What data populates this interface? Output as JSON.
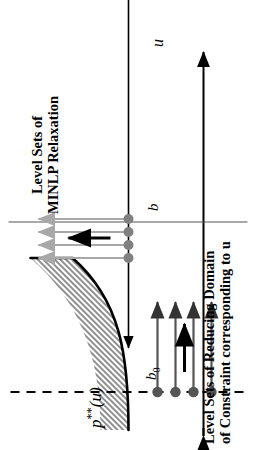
{
  "figure": {
    "background_color": "#ffffff",
    "captions": {
      "left": {
        "line1": "Level Sets of Reducing Domain",
        "line2": "of Constraint corresponding to u"
      },
      "right": {
        "line1": "Level Sets of",
        "line2": "MINLP Relaxation"
      }
    },
    "axes": {
      "vertical_label": "p",
      "vertical_label_sup": "**",
      "vertical_label_arg": "(u)",
      "horizontal_label": "u",
      "vertical_axis_color": "#000000",
      "horizontal_axis_color": "#000000"
    },
    "ticks": {
      "b0_label": "b",
      "b0_sub": "0",
      "b_label": "b"
    },
    "curve": {
      "color": "#000000",
      "band_fill": "#9a9a9a",
      "band_description": "hatched band above convex increasing curve"
    },
    "level_sets_minlp": {
      "dot_color": "#808080",
      "line_color": "#a8a8a8",
      "arrow_color": "#a8a8a8",
      "direction_arrow_color": "#000000",
      "count": 4
    },
    "level_sets_reducing_domain": {
      "dot_color": "#555555",
      "line_color": "#555555",
      "arrow_color": "#333333",
      "direction_arrow_color": "#000000",
      "count": 4
    }
  }
}
